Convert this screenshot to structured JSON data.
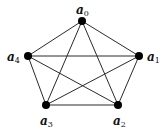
{
  "diagram": {
    "type": "complete-graph",
    "name": "K5",
    "nodes": [
      {
        "id": "a0",
        "base": "a",
        "sub": "0",
        "x": 82,
        "y": 21,
        "lx": 76,
        "ly": 14
      },
      {
        "id": "a1",
        "base": "a",
        "sub": "1",
        "x": 139,
        "y": 56,
        "lx": 147,
        "ly": 61
      },
      {
        "id": "a2",
        "base": "a",
        "sub": "2",
        "x": 118,
        "y": 105,
        "lx": 113,
        "ly": 125
      },
      {
        "id": "a3",
        "base": "a",
        "sub": "3",
        "x": 46,
        "y": 105,
        "lx": 40,
        "ly": 125
      },
      {
        "id": "a4",
        "base": "a",
        "sub": "4",
        "x": 28,
        "y": 56,
        "lx": 7,
        "ly": 61
      }
    ],
    "edges": [
      [
        "a0",
        "a1"
      ],
      [
        "a0",
        "a2"
      ],
      [
        "a0",
        "a3"
      ],
      [
        "a0",
        "a4"
      ],
      [
        "a1",
        "a2"
      ],
      [
        "a1",
        "a3"
      ],
      [
        "a1",
        "a4"
      ],
      [
        "a2",
        "a3"
      ],
      [
        "a2",
        "a4"
      ],
      [
        "a3",
        "a4"
      ]
    ],
    "colors": {
      "edge": "#2a2a2a",
      "node": "#000000",
      "label": "#111111"
    }
  }
}
